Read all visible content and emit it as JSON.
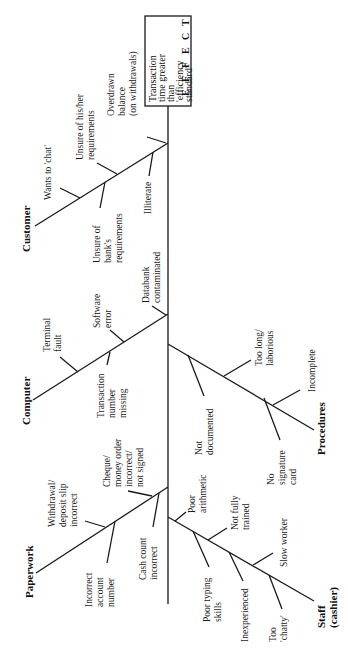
{
  "diagram": {
    "type": "fishbone",
    "orientation": "rotated-90-ccw",
    "effect": {
      "label_lines": [
        "Transaction",
        "time greater",
        "than",
        "'efficiency",
        "standard'"
      ],
      "side_letters": [
        "E",
        "F",
        "F",
        "E",
        "C",
        "T"
      ]
    },
    "categories": [
      {
        "name": "Customer",
        "causes": [
          {
            "lines": [
              "Wants to 'chat'"
            ]
          },
          {
            "lines": [
              "Unsure of his/her",
              "requirements"
            ]
          },
          {
            "lines": [
              "Overdrawn",
              "balance",
              "(on withdrawals)"
            ]
          },
          {
            "lines": [
              "Unsure of",
              "bank's",
              "requirements"
            ]
          },
          {
            "lines": [
              "Illiterate"
            ]
          }
        ]
      },
      {
        "name": "Computer",
        "causes": [
          {
            "lines": [
              "Terminal",
              "fault"
            ]
          },
          {
            "lines": [
              "Software",
              "error"
            ]
          },
          {
            "lines": [
              "Databank",
              "contaminated"
            ]
          },
          {
            "lines": [
              "Transaction",
              "number",
              "missing"
            ]
          }
        ]
      },
      {
        "name": "Paperwork",
        "causes": [
          {
            "lines": [
              "Withdrawal/",
              "deposit slip",
              "incorrect"
            ]
          },
          {
            "lines": [
              "Cheque/",
              "money order",
              "incorrect/",
              "not signed"
            ]
          },
          {
            "lines": [
              "Incorrect",
              "account",
              "number"
            ]
          },
          {
            "lines": [
              "Cash count",
              "incorrect"
            ]
          }
        ]
      },
      {
        "name": "Procedures",
        "causes": [
          {
            "lines": [
              "Not",
              "documented"
            ]
          },
          {
            "lines": [
              "Too long/",
              "laborious"
            ]
          },
          {
            "lines": [
              "No",
              "signature",
              "card"
            ]
          },
          {
            "lines": [
              "Incomplete"
            ]
          }
        ]
      },
      {
        "name": "Staff",
        "subtitle": "(cashier)",
        "causes": [
          {
            "lines": [
              "Poor",
              "arithmetic"
            ]
          },
          {
            "lines": [
              "Not fully",
              "trained"
            ]
          },
          {
            "lines": [
              "Poor typing",
              "skills"
            ]
          },
          {
            "lines": [
              "Slow worker"
            ]
          },
          {
            "lines": [
              "Inexperienced"
            ]
          },
          {
            "lines": [
              "Too",
              "'chatty'"
            ]
          }
        ]
      }
    ]
  }
}
